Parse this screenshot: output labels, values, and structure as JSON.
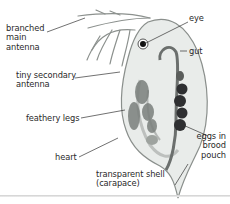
{
  "diagram": {
    "labels": {
      "branched_main_antenna": [
        "branched",
        "main",
        "antenna"
      ],
      "tiny_secondary_antenna": [
        "tiny secondary",
        "antenna"
      ],
      "feathery_legs": "feathery legs",
      "heart": "heart",
      "eye": "eye",
      "gut": "gut",
      "eggs_in_brood_pouch": [
        "eggs in",
        "brood",
        "pouch"
      ],
      "transparent_shell": [
        "transparent shell",
        "(carapace)"
      ]
    },
    "colors": {
      "text": "#2a2a2a",
      "leader_line": "#333333",
      "body_fill": "#e9ecea",
      "body_outline": "#8a8f8c",
      "eggs": "#2e2f31",
      "eye": "#111111"
    }
  }
}
